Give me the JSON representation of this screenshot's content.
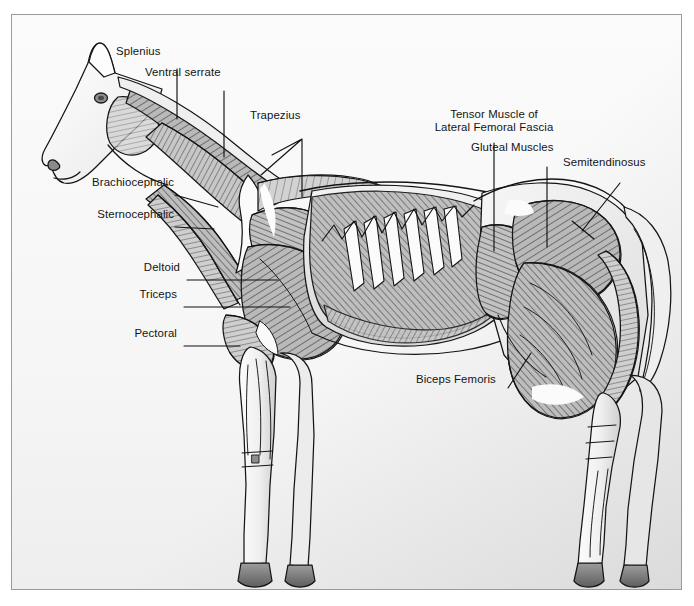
{
  "plate": {
    "title": "Equine superficial muscular anatomy — lateral view",
    "subject": "horse",
    "view": "left lateral",
    "style": "grayscale pen-and-ink anatomical illustration",
    "frame_color": "#9a9a9a",
    "background_color": "#f8f8f8",
    "label_text_color": "#141414",
    "leader_line_color": "#111111"
  },
  "labels": [
    {
      "id": "splenius",
      "text": "Splenius",
      "x": 154,
      "y": 44,
      "align": "left"
    },
    {
      "id": "ventral-serrate",
      "text": "Ventral serrate",
      "x": 185,
      "y": 65,
      "align": "left"
    },
    {
      "id": "trapezius",
      "text": "Trapezius",
      "x": 290,
      "y": 108,
      "align": "left"
    },
    {
      "id": "tensor-fascia",
      "text": "Tensor Muscle of\nLateral Femoral Fascia",
      "x": 438,
      "y": 107,
      "align": "left"
    },
    {
      "id": "gluteal",
      "text": "Gluteal Muscles",
      "x": 506,
      "y": 140,
      "align": "left"
    },
    {
      "id": "semitendinosus",
      "text": "Semitendinosus",
      "x": 596,
      "y": 155,
      "align": "left"
    },
    {
      "id": "brachiocephalic",
      "text": "Brachiocephalic",
      "x": 74,
      "y": 175,
      "align": "left"
    },
    {
      "id": "sternocephalic",
      "text": "Sternocephalic",
      "x": 76,
      "y": 207,
      "align": "left"
    },
    {
      "id": "deltoid",
      "text": "Deltoid",
      "x": 132,
      "y": 259,
      "align": "left"
    },
    {
      "id": "triceps",
      "text": "Triceps",
      "x": 132,
      "y": 286,
      "align": "left"
    },
    {
      "id": "pectoral",
      "text": "Pectoral",
      "x": 126,
      "y": 325,
      "align": "left"
    },
    {
      "id": "biceps-femoris",
      "text": "Biceps Femoris",
      "x": 418,
      "y": 370,
      "align": "left"
    }
  ],
  "label_text": {
    "splenius": "Splenius",
    "ventral_serrate": "Ventral serrate",
    "trapezius": "Trapezius",
    "tensor_line1": "Tensor Muscle of",
    "tensor_line2": "Lateral Femoral Fascia",
    "gluteal": "Gluteal Muscles",
    "semitendinosus": "Semitendinosus",
    "brachiocephalic": "Brachiocephalic",
    "sternocephalic": "Sternocephalic",
    "deltoid": "Deltoid",
    "triceps": "Triceps",
    "pectoral": "Pectoral",
    "biceps_femoris": "Biceps Femoris"
  },
  "palette": {
    "outline": "#151515",
    "muscle_dark": "#6f6f6f",
    "muscle_mid": "#9a9a9a",
    "muscle_light": "#c4c4c4",
    "tendon_white": "#fafafa",
    "hoof_dark": "#787878",
    "paper": "#f8f8f8"
  }
}
